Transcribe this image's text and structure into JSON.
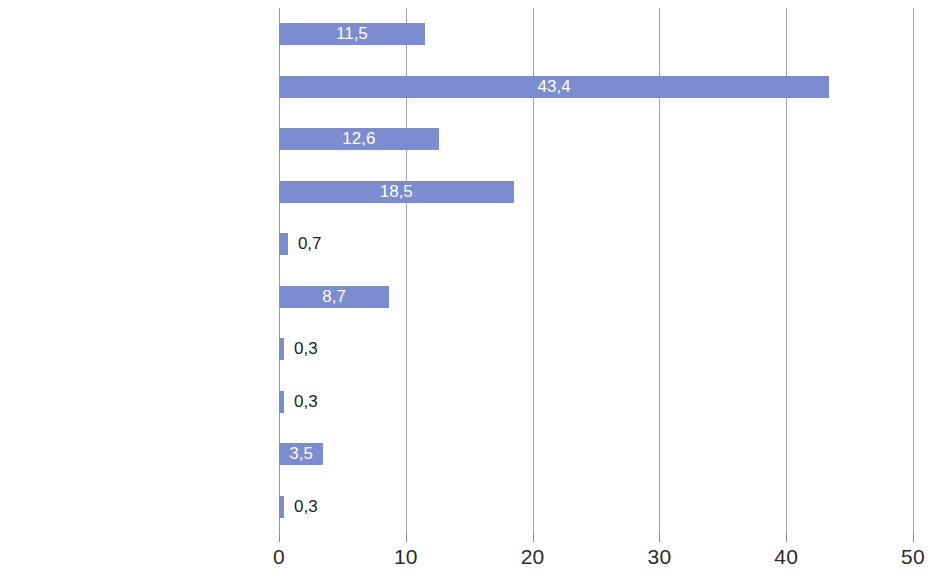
{
  "chart_data": {
    "type": "bar",
    "orientation": "horizontal",
    "title": "",
    "subtitle": "",
    "xlabel": "",
    "ylabel": "",
    "categories": [
      "Unter einem Monat vorher",
      "1 Monat vorher",
      "2 Monate vorher",
      "3 Monate vorher",
      "5 Monate vorher",
      "6 Monate vorher",
      "9 Monate vorher",
      "10 Monate vorher",
      "12 Monate vorher",
      "15 Monate vorher"
    ],
    "values": [
      11.5,
      43.4,
      12.6,
      18.5,
      0.7,
      8.7,
      0.3,
      0.3,
      3.5,
      0.3
    ],
    "value_labels": [
      "11,5",
      "43,4",
      "12,6",
      "18,5",
      "0,7",
      "8,7",
      "0,3",
      "0,3",
      "3,5",
      "0,3"
    ],
    "label_position": [
      "inside",
      "inside",
      "inside",
      "inside",
      "outside",
      "inside",
      "outside",
      "outside",
      "inside",
      "outside"
    ],
    "xlim": [
      0,
      50
    ],
    "xticks": [
      0,
      10,
      20,
      30,
      40,
      50
    ],
    "xtick_labels": [
      "0",
      "10",
      "20",
      "30",
      "40",
      "50"
    ],
    "grid": "vertical",
    "legend": "none",
    "bar_color": "#7b8cd0",
    "inside_label_color": "#ffffff",
    "outside_label_color": "#1d1d1d",
    "gridline_color": "#a6a6a6",
    "background_color": "#ffffff"
  }
}
